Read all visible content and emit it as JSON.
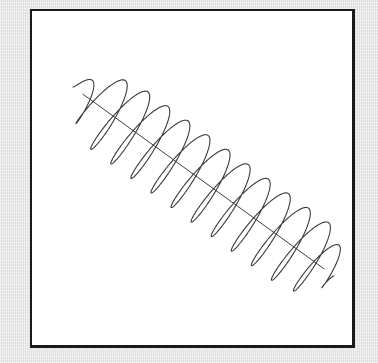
{
  "figure": {
    "title": "",
    "stroke_color": "#3a3a3a",
    "background_color": "#ffffff",
    "frame_color": "#1a1a1a"
  },
  "helix": {
    "axis_start": [
      73,
      87
    ],
    "axis_end": [
      334,
      276
    ],
    "turns": 13,
    "radius": 40,
    "minor_ratio": 0.55,
    "end_taper": 0.12,
    "samples": 2400
  }
}
